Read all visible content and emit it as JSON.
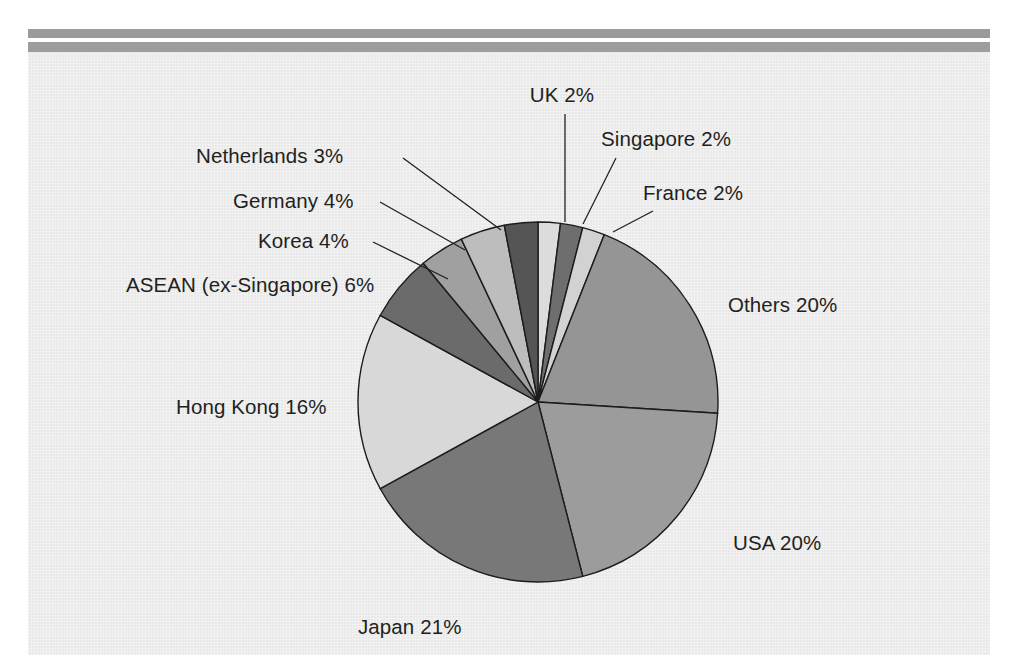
{
  "page": {
    "background_color": "#ffffff",
    "panel_color": "#e9e9e9",
    "rule_color": "#9a9a9a"
  },
  "chart_data": {
    "type": "pie",
    "title": "",
    "subtitle": "",
    "xlabel": "",
    "ylabel": "",
    "legend_position": "none",
    "grid": false,
    "units": "percent",
    "center": [
      510,
      350
    ],
    "radius": 180,
    "start_angle_deg": 0,
    "direction": "clockwise",
    "categories": [
      "UK",
      "Singapore",
      "France",
      "Others",
      "USA",
      "Japan",
      "Hong Kong",
      "ASEAN (ex-Singapore)",
      "Korea",
      "Germany",
      "Netherlands"
    ],
    "values": [
      2,
      2,
      2,
      20,
      20,
      21,
      16,
      6,
      4,
      4,
      3
    ],
    "colors": [
      "#dcdcdc",
      "#6e6e6e",
      "#d2d2d2",
      "#959595",
      "#9c9c9c",
      "#787878",
      "#d8d8d8",
      "#6b6b6b",
      "#a0a0a0",
      "#bdbdbd",
      "#555555"
    ],
    "labels": [
      {
        "text": "UK 2%",
        "x": 534,
        "y": 50,
        "anchor": "middle",
        "lead": [
          [
            537,
            62
          ],
          [
            537,
            170
          ]
        ]
      },
      {
        "text": "Singapore 2%",
        "x": 573,
        "y": 94,
        "anchor": "start",
        "lead": [
          [
            588,
            106
          ],
          [
            555,
            172
          ]
        ]
      },
      {
        "text": "France 2%",
        "x": 615,
        "y": 148,
        "anchor": "start",
        "lead": [
          [
            625,
            159
          ],
          [
            585,
            180
          ]
        ]
      },
      {
        "text": "Others 20%",
        "x": 700,
        "y": 260,
        "anchor": "start",
        "lead": null
      },
      {
        "text": "USA 20%",
        "x": 705,
        "y": 498,
        "anchor": "start",
        "lead": null
      },
      {
        "text": "Japan 21%",
        "x": 330,
        "y": 582,
        "anchor": "start",
        "lead": null
      },
      {
        "text": "Hong Kong 16%",
        "x": 148,
        "y": 362,
        "anchor": "start",
        "lead": null
      },
      {
        "text": "ASEAN (ex-Singapore) 6%",
        "x": 98,
        "y": 240,
        "anchor": "start",
        "lead": null
      },
      {
        "text": "Korea 4%",
        "x": 230,
        "y": 196,
        "anchor": "start",
        "lead": [
          [
            345,
            190
          ],
          [
            420,
            227
          ]
        ]
      },
      {
        "text": "Germany 4%",
        "x": 205,
        "y": 156,
        "anchor": "start",
        "lead": [
          [
            352,
            150
          ],
          [
            437,
            198
          ]
        ]
      },
      {
        "text": "Netherlands 3%",
        "x": 168,
        "y": 111,
        "anchor": "start",
        "lead": [
          [
            375,
            106
          ],
          [
            473,
            178
          ]
        ]
      }
    ]
  },
  "labels_flat": {
    "uk": "UK 2%",
    "singapore": "Singapore 2%",
    "france": "France 2%",
    "others": "Others 20%",
    "usa": "USA 20%",
    "japan": "Japan 21%",
    "hong_kong": "Hong Kong 16%",
    "asean": "ASEAN (ex-Singapore) 6%",
    "korea": "Korea 4%",
    "germany": "Germany 4%",
    "netherlands": "Netherlands 3%"
  }
}
